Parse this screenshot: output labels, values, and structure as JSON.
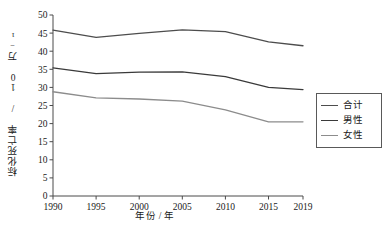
{
  "chart_data": {
    "type": "line",
    "title": "",
    "xlabel": "年份 / 年",
    "ylabel": "标化死亡率 / 10 万⁻¹",
    "x": [
      1990,
      1995,
      2000,
      2005,
      2010,
      2015,
      2019
    ],
    "categories": [
      "1990",
      "1995",
      "2000",
      "2005",
      "2010",
      "2015",
      "2019"
    ],
    "xlim": [
      1990,
      2019
    ],
    "ylim": [
      0,
      50
    ],
    "yticks": [
      0,
      5,
      10,
      15,
      20,
      25,
      30,
      35,
      40,
      45,
      50
    ],
    "ytick_labels": [
      "0",
      "5",
      "10",
      "15",
      "20",
      "25",
      "30",
      "35",
      "40",
      "45",
      "50"
    ],
    "xtick_labels": [
      "1990",
      "1995",
      "2000",
      "2005",
      "2010",
      "2015",
      "2019"
    ],
    "grid": false,
    "legend_position": "right",
    "series": [
      {
        "name": "合计",
        "color": "#4d4d4d",
        "values": [
          45.8,
          43.8,
          44.9,
          45.9,
          45.4,
          42.6,
          41.5
        ]
      },
      {
        "name": "男性",
        "color": "#3a3a3a",
        "values": [
          35.4,
          33.8,
          34.2,
          34.3,
          33.0,
          30.0,
          29.4
        ]
      },
      {
        "name": "女性",
        "color": "#8c8c8c",
        "values": [
          28.8,
          27.1,
          26.8,
          26.2,
          23.8,
          20.5,
          20.5
        ]
      }
    ]
  },
  "legend": {
    "items": [
      {
        "label": "合计"
      },
      {
        "label": "男性"
      },
      {
        "label": "女性"
      }
    ]
  },
  "caption": {
    "text": ""
  }
}
